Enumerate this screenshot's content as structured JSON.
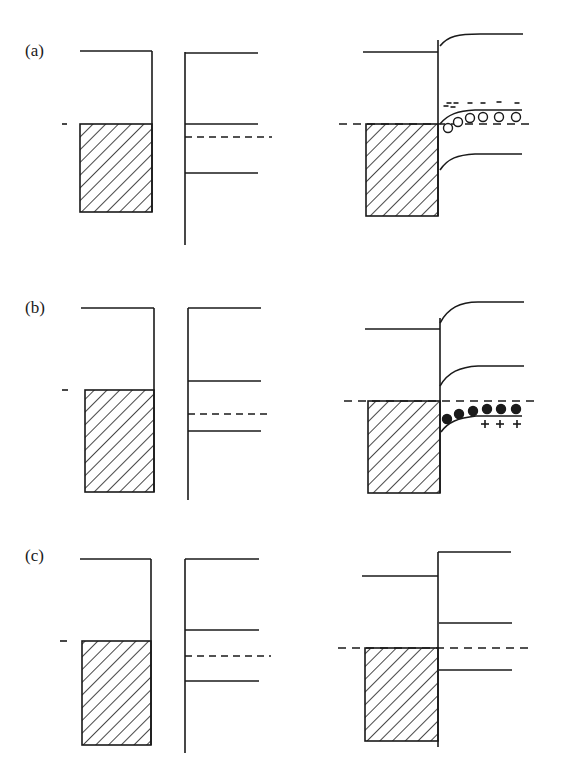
{
  "figure": {
    "stroke_color": "#1a1a1a",
    "background": "#ffffff",
    "panels": [
      {
        "id": "a",
        "label": "(a)",
        "label_pos": [
          25,
          58
        ],
        "separated": {
          "metal": {
            "top": [
              80,
              51
            ],
            "right_x": 152,
            "fermi_y": 124,
            "bottom_y": 212,
            "left_x": 80,
            "fermi_tick": [
              62,
              67
            ]
          },
          "semi": {
            "x": 185,
            "vac_y": 53,
            "top_y": 52,
            "bottom_y": 245,
            "ec_y": 124,
            "ef_y": 137,
            "ev_y": 173,
            "right_x": 258,
            "ef_right_x": 272
          }
        },
        "contact": {
          "metal": {
            "left_x": 366,
            "right_x": 438,
            "vac_y": 52,
            "vac_left_x": 363,
            "fermi_y": 124,
            "bottom_y": 216
          },
          "interface_top_y": 40,
          "fermi_line": {
            "x1": 339,
            "x2": 533,
            "y": 124
          },
          "curves": [
            {
              "name": "vacuum-level",
              "d": "M440 46 C448 36 458 34 480 34 L523 34"
            },
            {
              "name": "conduction-band",
              "d": "M440 124 C448 114 458 111 475 110 L522 110"
            },
            {
              "name": "valence-band",
              "d": "M440 170 C448 158 458 155 475 154 L522 154"
            }
          ],
          "carriers": {
            "type": "holes-open-circles",
            "positions": [
              [
                448,
                128
              ],
              [
                458,
                122
              ],
              [
                470,
                118
              ],
              [
                483,
                117
              ],
              [
                499,
                117
              ],
              [
                516,
                117
              ]
            ]
          },
          "charges": {
            "sign": "-",
            "positions": [
              [
                449,
                103
              ],
              [
                456,
                103
              ],
              [
                470,
                103
              ],
              [
                483,
                103
              ],
              [
                499,
                102
              ],
              [
                517,
                103
              ],
              [
                446,
                106
              ],
              [
                453,
                107
              ]
            ]
          }
        }
      },
      {
        "id": "b",
        "label": "(b)",
        "label_pos": [
          25,
          315
        ],
        "separated": {
          "metal": {
            "top": [
              81,
              308
            ],
            "right_x": 154,
            "fermi_y": 390,
            "bottom_y": 492,
            "left_x": 85,
            "fermi_tick": [
              62,
              68
            ]
          },
          "semi": {
            "x": 188,
            "vac_y": 308,
            "top_y": 308,
            "bottom_y": 500,
            "ec_y": 381,
            "ef_y": 414,
            "ev_y": 431,
            "right_x": 261,
            "ef_right_x": 272
          }
        },
        "contact": {
          "metal": {
            "left_x": 368,
            "right_x": 440,
            "vac_y": 329,
            "vac_left_x": 365,
            "fermi_y": 401,
            "bottom_y": 493
          },
          "interface_top_y": 318,
          "fermi_line": {
            "x1": 344,
            "x2": 535,
            "y": 401
          },
          "curves": [
            {
              "name": "vacuum-level",
              "d": "M440 323 C448 308 460 302 478 302 L524 302"
            },
            {
              "name": "conduction-band",
              "d": "M440 386 C448 372 460 367 478 366 L524 366"
            },
            {
              "name": "valence-band",
              "d": "M441 432 C448 422 458 418 476 416 L522 416"
            }
          ],
          "carriers": {
            "type": "electrons-filled-dots",
            "positions": [
              [
                447,
                419
              ],
              [
                459,
                414
              ],
              [
                473,
                411
              ],
              [
                487,
                409
              ],
              [
                501,
                409
              ],
              [
                516,
                409
              ]
            ]
          },
          "charges": {
            "sign": "+",
            "positions": [
              [
                485,
                424
              ],
              [
                500,
                424
              ],
              [
                517,
                424
              ]
            ]
          }
        }
      },
      {
        "id": "c",
        "label": "(c)",
        "label_pos": [
          25,
          563
        ],
        "separated": {
          "metal": {
            "top": [
              80,
              559
            ],
            "right_x": 151,
            "fermi_y": 641,
            "bottom_y": 745,
            "left_x": 82,
            "fermi_tick": [
              60,
              67
            ]
          },
          "semi": {
            "x": 185,
            "vac_y": 559,
            "top_y": 559,
            "bottom_y": 753,
            "ec_y": 630,
            "ef_y": 656,
            "ev_y": 681,
            "right_x": 259,
            "ef_right_x": 271
          }
        },
        "contact": {
          "metal": {
            "left_x": 365,
            "right_x": 438,
            "vac_y": 576,
            "vac_left_x": 362,
            "fermi_y": 648,
            "bottom_y": 741
          },
          "interface_top_y": 552,
          "interface_bottom_y": 747,
          "fermi_line": {
            "x1": 338,
            "x2": 530,
            "y": 648
          },
          "flat_lines": [
            {
              "name": "vacuum-level",
              "y": 552,
              "x1": 438,
              "x2": 511
            },
            {
              "name": "conduction-band",
              "y": 623,
              "x1": 439,
              "x2": 512
            },
            {
              "name": "valence-band",
              "y": 670,
              "x1": 439,
              "x2": 512
            }
          ]
        }
      }
    ]
  }
}
